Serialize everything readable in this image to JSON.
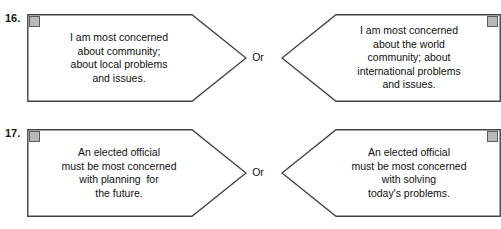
{
  "page": {
    "background_color": "#ffffff",
    "border_color": "#444444",
    "checkbox_fill": "#b9b9b9",
    "checkbox_border": "#5c5c5c"
  },
  "connector_label": "Or",
  "items": [
    {
      "number": "16.",
      "left": {
        "checkbox_name": "answer-checkbox-16-a",
        "lines": [
          "I am most concerned",
          "about community;",
          "about local problems",
          "and issues."
        ]
      },
      "right": {
        "checkbox_name": "answer-checkbox-16-b",
        "lines": [
          "I am most concerned",
          "about the world",
          "community; about",
          "international problems",
          "and issues."
        ]
      }
    },
    {
      "number": "17.",
      "left": {
        "checkbox_name": "answer-checkbox-17-a",
        "lines": [
          "An elected official",
          "must be most concerned",
          "with planning  for",
          "the future."
        ]
      },
      "right": {
        "checkbox_name": "answer-checkbox-17-b",
        "lines": [
          "An elected official",
          "must be most concerned",
          "with solving",
          "today's problems."
        ]
      }
    }
  ]
}
